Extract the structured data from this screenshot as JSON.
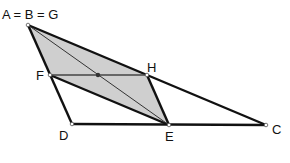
{
  "diagram": {
    "labels": {
      "A": "A = B = G",
      "F": "F",
      "H": "H",
      "D": "D",
      "E": "E",
      "C": "C"
    },
    "points": {
      "A": [
        28,
        25
      ],
      "F": [
        50,
        75
      ],
      "H": [
        147,
        75
      ],
      "D": [
        72,
        124
      ],
      "E": [
        169,
        125
      ],
      "C": [
        266,
        125
      ],
      "M": [
        98,
        75
      ]
    },
    "shaded_polygon": [
      "A",
      "H",
      "E",
      "F"
    ],
    "colors": {
      "fill": "#cfcfcf",
      "stroke": "#111111",
      "thin_stroke": "#333333"
    }
  }
}
